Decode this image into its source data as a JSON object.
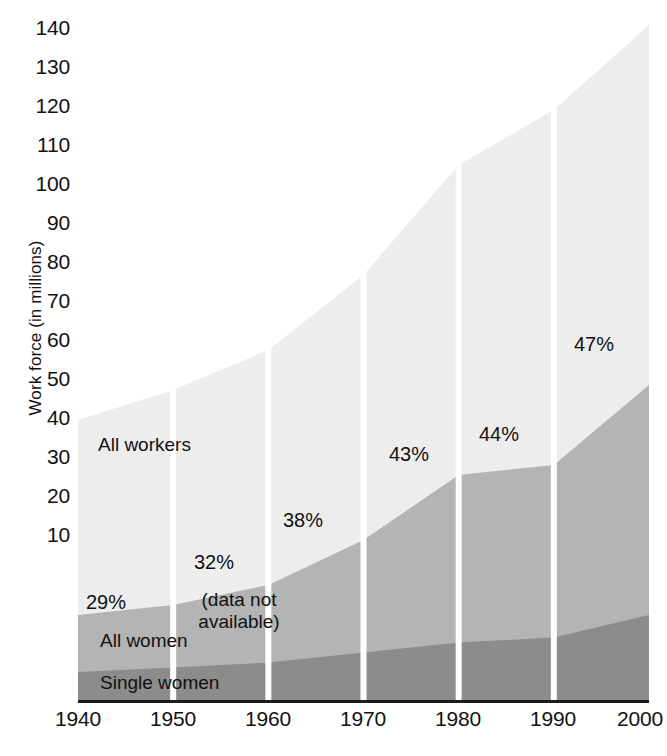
{
  "chart_data": {
    "type": "area",
    "stacked": true,
    "title": "",
    "xlabel": "",
    "ylabel": "Work force (in millions)",
    "x": [
      1940,
      1950,
      1960,
      1970,
      1980,
      1990,
      2000
    ],
    "xlim": [
      1940,
      2000
    ],
    "ylim": [
      0,
      140
    ],
    "yticks": [
      10,
      20,
      30,
      40,
      50,
      60,
      70,
      80,
      90,
      100,
      110,
      120,
      130,
      140
    ],
    "xticks": [
      "1940",
      "1950",
      "1960",
      "1970",
      "1980",
      "1990",
      "2000"
    ],
    "grid": false,
    "legend_position": "in-plot",
    "series": [
      {
        "name": "All workers",
        "color": "#ededed",
        "values": [
          56,
          62,
          70,
          85,
          107,
          118,
          135
        ]
      },
      {
        "name": "All women",
        "color": "#b4b4b4",
        "values": [
          17,
          19,
          23,
          32,
          45,
          47,
          63
        ]
      },
      {
        "name": "Single women",
        "color": "#8c8c8c",
        "values": [
          5.6,
          6.5,
          7.5,
          9.5,
          11.5,
          12.5,
          17
        ]
      }
    ],
    "annotations": [
      {
        "text": "29%",
        "x": 1940,
        "y": 19.5
      },
      {
        "text": "32%",
        "x": 1955,
        "y": 27.5
      },
      {
        "text": "38%",
        "x": 1968,
        "y": 33.5
      },
      {
        "text": "43%",
        "x": 1978,
        "y": 43.0
      },
      {
        "text": "44%",
        "x": 1989,
        "y": 45.5
      },
      {
        "text": "47%",
        "x": 1997,
        "y": 60.5
      },
      {
        "text": "(data not available)",
        "x": 1957,
        "y": 20.5
      }
    ],
    "series_labels": [
      {
        "text": "All workers",
        "x": 1941,
        "y": 48.5
      },
      {
        "text": "All women",
        "x": 1941,
        "y": 10.5
      },
      {
        "text": "Single women",
        "x": 1941,
        "y": 3.0
      }
    ]
  },
  "axis": {
    "y_title": "Work force (in millions)",
    "y_ticks": [
      "140",
      "130",
      "120",
      "110",
      "100",
      "90",
      "80",
      "70",
      "60",
      "50",
      "40",
      "30",
      "20",
      "10"
    ],
    "x_ticks": [
      "1940",
      "1950",
      "1960",
      "1970",
      "1980",
      "1990",
      "2000"
    ]
  },
  "labels": {
    "all_workers": "All workers",
    "all_women": "All women",
    "single_women": "Single women",
    "data_not_available_line1": "(data not",
    "data_not_available_line2": "available)",
    "pct_1940": "29%",
    "pct_1960": "32%",
    "pct_1970": "38%",
    "pct_1980": "43%",
    "pct_1990": "44%",
    "pct_2000": "47%"
  },
  "colors": {
    "all_workers_band": "#ededed",
    "all_women_band": "#b4b4b4",
    "single_women_band": "#8c8c8c",
    "separator": "#ffffff",
    "axis_line": "#1c1c1c",
    "text": "#111111",
    "page_background": "#ffffff"
  }
}
